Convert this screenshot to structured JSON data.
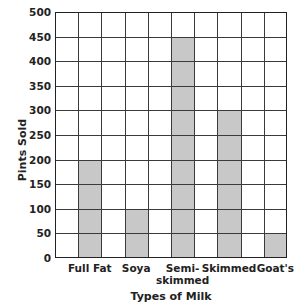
{
  "chart_data": {
    "type": "bar",
    "title": "",
    "xlabel": "Types of Milk",
    "ylabel": "Pints Sold",
    "categories": [
      "Full Fat",
      "Soya",
      "Semi-skimmed",
      "Skimmed",
      "Goat's"
    ],
    "category_labels": [
      [
        "Full Fat"
      ],
      [
        "Soya"
      ],
      [
        "Semi-",
        "skimmed"
      ],
      [
        "Skimmed"
      ],
      [
        "Goat's"
      ]
    ],
    "values": [
      200,
      100,
      450,
      300,
      50
    ],
    "ylim": [
      0,
      500
    ],
    "yticks": [
      0,
      50,
      100,
      150,
      200,
      250,
      300,
      350,
      400,
      450,
      500
    ],
    "ytick_labels": [
      "0",
      "50",
      "100",
      "150",
      "200",
      "250",
      "300",
      "350",
      "400",
      "450",
      "500"
    ],
    "grid": true,
    "grid_columns": 10,
    "bar_columns": [
      1,
      3,
      5,
      7,
      9
    ],
    "bar_color": "#c8c8c8",
    "grid_color": "#3a3a3a",
    "legend": null
  }
}
